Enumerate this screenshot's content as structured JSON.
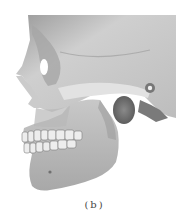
{
  "figure": {
    "caption": "(b)",
    "colors": {
      "background": "#ffffff",
      "bone_light": "#d8d8d8",
      "bone_mid": "#b4b4b4",
      "bone_dark": "#6e6e6e",
      "cavity": "#ffffff"
    }
  }
}
